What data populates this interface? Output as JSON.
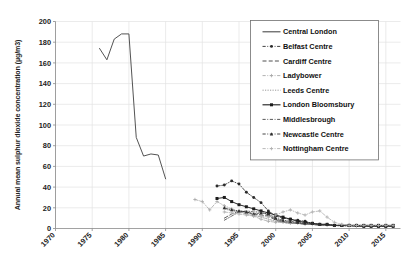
{
  "chart_data": {
    "type": "line",
    "title": "",
    "subtitle": "",
    "xlabel": "",
    "ylabel": "Annual mean sulphur dioxide concentration (µg/m3)",
    "xlim": [
      1970,
      2017
    ],
    "ylim": [
      0,
      200
    ],
    "grid": true,
    "legend_position": "top-right",
    "x_tick_labels": [
      "1970",
      "1975",
      "1980",
      "1985",
      "1990",
      "1995",
      "2000",
      "2005",
      "2010",
      "2015"
    ],
    "x_ticks": [
      1970,
      1975,
      1980,
      1985,
      1990,
      1995,
      2000,
      2005,
      2010,
      2015
    ],
    "y_tick_labels": [
      "0",
      "20",
      "40",
      "60",
      "80",
      "100",
      "120",
      "140",
      "160",
      "180",
      "200"
    ],
    "y_ticks": [
      0,
      20,
      40,
      60,
      80,
      100,
      120,
      140,
      160,
      180,
      200
    ],
    "series": [
      {
        "name": "Central London",
        "color": "#4a4a4a",
        "style": "solid",
        "marker": "none",
        "x": [
          1976,
          1977,
          1978,
          1979,
          1980,
          1981,
          1982,
          1983,
          1984,
          1985
        ],
        "values": [
          174,
          163,
          183,
          188,
          188,
          88,
          70,
          72,
          71,
          48
        ]
      },
      {
        "name": "Belfast Centre",
        "color": "#2b2b2b",
        "style": "dash-dot",
        "marker": "circle",
        "x": [
          1992,
          1993,
          1994,
          1995,
          1996,
          1997,
          1998,
          1999,
          2000,
          2001,
          2002,
          2003,
          2004,
          2005,
          2006,
          2007,
          2008,
          2009,
          2010,
          2011,
          2012,
          2013,
          2014,
          2015,
          2016
        ],
        "values": [
          41,
          42,
          46,
          43,
          35,
          30,
          25,
          17,
          12,
          10,
          9,
          8,
          7,
          5,
          4,
          4,
          3,
          3,
          3,
          3,
          3,
          3,
          2,
          2,
          3
        ]
      },
      {
        "name": "Cardiff Centre",
        "color": "#3a3a3a",
        "style": "dashed",
        "marker": "none",
        "x": [
          1993,
          1994,
          1995,
          1996,
          1997,
          1998,
          1999,
          2000,
          2001,
          2002,
          2003,
          2004,
          2005,
          2006,
          2007,
          2008,
          2009,
          2010,
          2011,
          2012,
          2013,
          2014,
          2015,
          2016
        ],
        "values": [
          10,
          14,
          17,
          16,
          14,
          13,
          12,
          8,
          6,
          5,
          5,
          4,
          4,
          3,
          3,
          3,
          3,
          3,
          2,
          2,
          2,
          2,
          2,
          3
        ]
      },
      {
        "name": "Ladybower",
        "color": "#a8a8a8",
        "style": "dash-dot",
        "marker": "plus",
        "x": [
          1989,
          1990,
          1991,
          1992,
          1993,
          1994,
          1995,
          1996,
          1997,
          1998,
          1999,
          2000,
          2001,
          2002,
          2003,
          2004,
          2005,
          2006,
          2007,
          2008,
          2009,
          2010,
          2011,
          2012,
          2013,
          2014,
          2015,
          2016
        ],
        "values": [
          28,
          26,
          18,
          26,
          22,
          19,
          16,
          14,
          12,
          9,
          7,
          6,
          6,
          5,
          5,
          4,
          4,
          4,
          3,
          3,
          3,
          3,
          2,
          2,
          2,
          2,
          2,
          2
        ]
      },
      {
        "name": "Leeds Centre",
        "color": "#8f8f8f",
        "style": "dotted",
        "marker": "none",
        "x": [
          1993,
          1994,
          1995,
          1996,
          1997,
          1998,
          1999,
          2000,
          2001,
          2002,
          2003,
          2004,
          2005,
          2006,
          2007,
          2008,
          2009,
          2010,
          2011,
          2012,
          2013,
          2014,
          2015,
          2016
        ],
        "values": [
          19,
          17,
          16,
          15,
          13,
          11,
          9,
          7,
          6,
          5,
          5,
          4,
          4,
          3,
          3,
          3,
          2,
          2,
          2,
          2,
          2,
          2,
          2,
          2
        ]
      },
      {
        "name": "London Bloomsbury",
        "color": "#1c1c1c",
        "style": "solid",
        "marker": "square",
        "x": [
          1992,
          1993,
          1994,
          1995,
          1996,
          1997,
          1998,
          1999,
          2000,
          2001,
          2002,
          2003,
          2004,
          2005,
          2006,
          2007,
          2008,
          2009,
          2010,
          2011,
          2012,
          2013,
          2014,
          2015,
          2016
        ],
        "values": [
          29,
          30,
          26,
          23,
          21,
          19,
          17,
          15,
          13,
          11,
          9,
          7,
          6,
          5,
          4,
          4,
          3,
          3,
          3,
          3,
          3,
          3,
          3,
          3,
          3
        ]
      },
      {
        "name": "Middlesbrough",
        "color": "#454545",
        "style": "dash-dot",
        "marker": "none",
        "x": [
          1993,
          1994,
          1995,
          1996,
          1997,
          1998,
          1999,
          2000,
          2001,
          2002,
          2003,
          2004,
          2005,
          2006,
          2007,
          2008,
          2009,
          2010,
          2011,
          2012,
          2013,
          2014,
          2015,
          2016
        ],
        "values": [
          8,
          12,
          16,
          17,
          16,
          16,
          13,
          9,
          7,
          6,
          5,
          5,
          4,
          4,
          3,
          3,
          3,
          3,
          2,
          2,
          2,
          2,
          2,
          2
        ]
      },
      {
        "name": "Newcastle Centre",
        "color": "#2f2f2f",
        "style": "dash-dot",
        "marker": "triangle",
        "x": [
          1993,
          1994,
          1995,
          1996,
          1997,
          1998,
          1999,
          2000,
          2001,
          2002,
          2003,
          2004,
          2005,
          2006,
          2007,
          2008,
          2009,
          2010,
          2011,
          2012,
          2013,
          2014,
          2015,
          2016
        ],
        "values": [
          20,
          18,
          17,
          16,
          14,
          15,
          14,
          10,
          8,
          7,
          6,
          5,
          5,
          4,
          4,
          3,
          3,
          3,
          3,
          2,
          2,
          2,
          2,
          2
        ]
      },
      {
        "name": "Nottingham Centre",
        "color": "#b0b0b0",
        "style": "dash-dot",
        "marker": "plus",
        "x": [
          1993,
          1994,
          1995,
          1996,
          1997,
          1998,
          1999,
          2000,
          2001,
          2002,
          2003,
          2004,
          2005,
          2006,
          2007,
          2008,
          2009,
          2010,
          2011,
          2012,
          2013,
          2014,
          2015,
          2016
        ],
        "values": [
          16,
          15,
          14,
          13,
          12,
          12,
          11,
          13,
          16,
          18,
          15,
          13,
          16,
          17,
          11,
          6,
          4,
          3,
          3,
          3,
          3,
          3,
          3,
          3
        ]
      }
    ]
  },
  "legend": {
    "items": [
      {
        "label": "Central London"
      },
      {
        "label": "Belfast Centre"
      },
      {
        "label": "Cardiff Centre"
      },
      {
        "label": "Ladybower"
      },
      {
        "label": "Leeds Centre"
      },
      {
        "label": "London Bloomsbury"
      },
      {
        "label": "Middlesbrough"
      },
      {
        "label": "Newcastle Centre"
      },
      {
        "label": "Nottingham Centre"
      }
    ]
  }
}
